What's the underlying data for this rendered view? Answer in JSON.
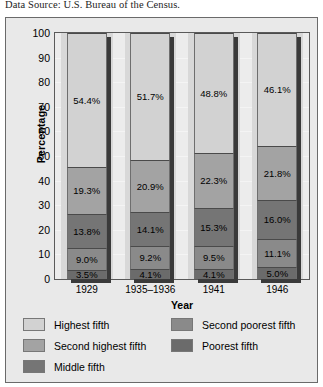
{
  "caption": "Data Source: U.S. Bureau of the Census.",
  "chart_data": {
    "type": "bar",
    "stacked": true,
    "stack_total": 100,
    "title": "",
    "xlabel": "Year",
    "ylabel": "Percentage",
    "ylim": [
      0,
      100
    ],
    "yticks": [
      100,
      90,
      80,
      70,
      60,
      50,
      40,
      30,
      20,
      10,
      0
    ],
    "grid": true,
    "legend_position": "bottom",
    "categories": [
      "1929",
      "1935–1936",
      "1941",
      "1946"
    ],
    "series": [
      {
        "name": "Poorest fifth",
        "color": "#6b6b6b",
        "values": [
          3.5,
          4.1,
          4.1,
          5.0
        ],
        "labels": [
          "3.5%",
          "4.1%",
          "4.1%",
          "5.0%"
        ]
      },
      {
        "name": "Second poorest fifth",
        "color": "#8a8a8a",
        "values": [
          9.0,
          9.2,
          9.5,
          11.1
        ],
        "labels": [
          "9.0%",
          "9.2%",
          "9.5%",
          "11.1%"
        ]
      },
      {
        "name": "Middle fifth",
        "color": "#757575",
        "values": [
          13.8,
          14.1,
          15.3,
          16.0
        ],
        "labels": [
          "13.8%",
          "14.1%",
          "15.3%",
          "16.0%"
        ]
      },
      {
        "name": "Second highest fifth",
        "color": "#a3a3a3",
        "values": [
          19.3,
          20.9,
          22.3,
          21.8
        ],
        "labels": [
          "19.3%",
          "20.9%",
          "22.3%",
          "21.8%"
        ]
      },
      {
        "name": "Highest fifth",
        "color": "#d2d2d2",
        "values": [
          54.4,
          51.7,
          48.8,
          46.1
        ],
        "labels": [
          "54.4%",
          "51.7%",
          "48.8%",
          "46.1%"
        ]
      }
    ],
    "legend_entries": [
      {
        "label": "Highest fifth",
        "color": "#d2d2d2"
      },
      {
        "label": "Second highest fifth",
        "color": "#a3a3a3"
      },
      {
        "label": "Middle fifth",
        "color": "#757575"
      },
      {
        "label": "Second poorest fifth",
        "color": "#8a8a8a"
      },
      {
        "label": "Poorest fifth",
        "color": "#6b6b6b"
      }
    ]
  }
}
